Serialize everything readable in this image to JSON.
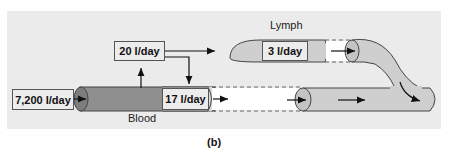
{
  "diagram": {
    "labels": {
      "blood": "Blood",
      "lymph": "Lymph",
      "caption": "(b)"
    },
    "flows": {
      "arterial_inflow": "7,200 l/day",
      "filtration_out": "20 l/day",
      "reabsorption": "17 l/day",
      "lymph_return": "3 l/day"
    },
    "colors": {
      "background": "#ebebeb",
      "blood_vessel_dark": "#8f8f8f",
      "vessel_light": "#cfcfcf",
      "box_fill": "#ececec",
      "stroke": "#444444"
    }
  }
}
